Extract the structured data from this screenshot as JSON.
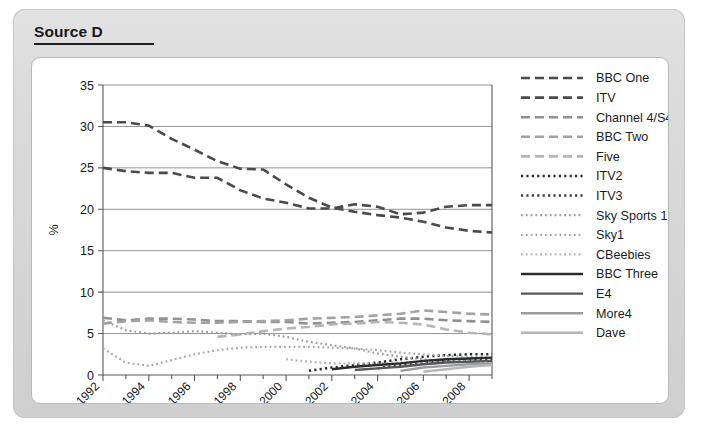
{
  "panel": {
    "title": "Source D"
  },
  "chart_data": {
    "type": "line",
    "title": "",
    "xlabel": "",
    "ylabel": "%",
    "xlim": [
      1992,
      2009
    ],
    "ylim": [
      0,
      35
    ],
    "yticks": [
      0,
      5,
      10,
      15,
      20,
      25,
      30,
      35
    ],
    "ytick_labels": [
      "0",
      "5",
      "10",
      "15",
      "20",
      "25",
      "30",
      "35"
    ],
    "xticks": [
      1992,
      1994,
      1996,
      1998,
      2000,
      2002,
      2004,
      2006,
      2008
    ],
    "xtick_labels": [
      "1992",
      "1994",
      "1996",
      "1998",
      "2000",
      "2002",
      "2004",
      "2006",
      "2008"
    ],
    "xtick_rotation": 45,
    "minor_xticks": [
      1993,
      1995,
      1997,
      1999,
      2001,
      2003,
      2005,
      2007,
      2009
    ],
    "grid": "horizontal",
    "legend_position": "right",
    "x": [
      1992,
      1993,
      1994,
      1995,
      1996,
      1997,
      1998,
      1999,
      2000,
      2001,
      2002,
      2003,
      2004,
      2005,
      2006,
      2007,
      2008,
      2009
    ],
    "series": [
      {
        "name": "BBC One",
        "style": "dashed",
        "color": "#4a4a4c",
        "width": 2.6,
        "dash": "9,5",
        "values": [
          25.0,
          24.6,
          24.4,
          24.4,
          23.8,
          23.8,
          22.3,
          21.3,
          20.8,
          20.1,
          20.1,
          20.6,
          20.3,
          19.4,
          19.6,
          20.3,
          20.5,
          20.5
        ]
      },
      {
        "name": "ITV",
        "style": "dashed",
        "color": "#4a4a4c",
        "width": 2.6,
        "dash": "9,5",
        "values": [
          30.5,
          30.5,
          30.1,
          28.5,
          27.2,
          25.8,
          24.9,
          24.8,
          23.0,
          21.4,
          20.2,
          19.7,
          19.3,
          19.0,
          18.5,
          17.8,
          17.4,
          17.2
        ]
      },
      {
        "name": "Channel 4/S4C",
        "style": "dashed",
        "color": "#8e9092",
        "width": 2.6,
        "dash": "9,5",
        "values": [
          6.9,
          6.6,
          6.8,
          6.8,
          6.7,
          6.5,
          6.5,
          6.4,
          6.4,
          6.2,
          6.3,
          6.4,
          6.6,
          6.8,
          6.8,
          6.6,
          6.5,
          6.4
        ]
      },
      {
        "name": "BBC Two",
        "style": "dashed",
        "color": "#a0a2a4",
        "width": 2.6,
        "dash": "9,5",
        "values": [
          6.2,
          6.5,
          6.6,
          6.4,
          6.3,
          6.3,
          6.4,
          6.5,
          6.6,
          6.8,
          6.9,
          7.0,
          7.2,
          7.4,
          7.8,
          7.6,
          7.4,
          7.3
        ]
      },
      {
        "name": "Five",
        "style": "dashed",
        "color": "#b4b6b8",
        "width": 2.6,
        "dash": "9,5",
        "values": [
          null,
          null,
          null,
          null,
          null,
          4.6,
          4.9,
          5.3,
          5.6,
          5.8,
          6.1,
          6.2,
          6.4,
          6.3,
          6.1,
          5.5,
          5.1,
          4.9
        ]
      },
      {
        "name": "ITV2",
        "style": "dotted",
        "color": "#2a2c2e",
        "width": 2.5,
        "dash": "2.2,3.2",
        "values": [
          null,
          null,
          null,
          null,
          null,
          null,
          null,
          null,
          null,
          0.5,
          0.9,
          1.2,
          1.5,
          1.9,
          2.2,
          2.4,
          2.5,
          2.5
        ]
      },
      {
        "name": "ITV3",
        "style": "dotted",
        "color": "#3c3e40",
        "width": 2.5,
        "dash": "2.2,3.2",
        "values": [
          null,
          null,
          null,
          null,
          null,
          null,
          null,
          null,
          null,
          null,
          null,
          null,
          0.8,
          1.2,
          1.5,
          1.7,
          1.8,
          1.9
        ]
      },
      {
        "name": "Sky Sports 1",
        "style": "dotted",
        "color": "#9a9c9e",
        "width": 2.2,
        "dash": "1.8,3.0",
        "values": [
          6.6,
          5.4,
          5.0,
          5.1,
          5.3,
          5.1,
          4.9,
          5.0,
          4.6,
          4.0,
          3.6,
          3.2,
          2.6,
          2.2,
          1.9,
          1.7,
          1.6,
          1.5
        ]
      },
      {
        "name": "Sky1",
        "style": "dotted",
        "color": "#a6a8aa",
        "width": 2.2,
        "dash": "1.8,3.0",
        "values": [
          3.2,
          1.5,
          1.1,
          1.8,
          2.5,
          3.0,
          3.3,
          3.4,
          3.4,
          3.4,
          3.3,
          3.2,
          3.0,
          2.7,
          2.5,
          2.3,
          2.2,
          2.1
        ]
      },
      {
        "name": "CBeebies",
        "style": "dotted",
        "color": "#b0b2b4",
        "width": 2.2,
        "dash": "1.8,3.0",
        "values": [
          null,
          null,
          null,
          null,
          null,
          null,
          null,
          null,
          1.9,
          1.6,
          1.4,
          1.4,
          1.4,
          1.5,
          1.6,
          1.6,
          1.7,
          1.7
        ]
      },
      {
        "name": "BBC Three",
        "style": "solid",
        "color": "#2a2c2e",
        "width": 2.4,
        "dash": "",
        "values": [
          null,
          null,
          null,
          null,
          null,
          null,
          null,
          null,
          null,
          null,
          0.7,
          1.0,
          1.2,
          1.4,
          1.7,
          1.9,
          2.0,
          2.1
        ]
      },
      {
        "name": "E4",
        "style": "solid",
        "color": "#58585a",
        "width": 2.4,
        "dash": "",
        "values": [
          null,
          null,
          null,
          null,
          null,
          null,
          null,
          null,
          null,
          null,
          null,
          0.6,
          0.8,
          1.0,
          1.3,
          1.5,
          1.6,
          1.7
        ]
      },
      {
        "name": "More4",
        "style": "solid",
        "color": "#9a9c9e",
        "width": 2.4,
        "dash": "",
        "values": [
          null,
          null,
          null,
          null,
          null,
          null,
          null,
          null,
          null,
          null,
          null,
          null,
          null,
          0.5,
          0.9,
          1.1,
          1.3,
          1.4
        ]
      },
      {
        "name": "Dave",
        "style": "solid",
        "color": "#b4b6b8",
        "width": 2.4,
        "dash": "",
        "values": [
          null,
          null,
          null,
          null,
          null,
          null,
          null,
          null,
          null,
          null,
          null,
          null,
          null,
          null,
          0.4,
          0.7,
          1.0,
          1.2
        ]
      }
    ]
  }
}
